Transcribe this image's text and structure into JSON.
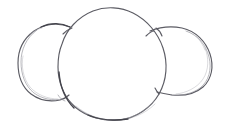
{
  "artwork": {
    "title": "Hand-drawn sketch of three overlapping circles",
    "medium": "pencil sketch",
    "background_color": "#ffffff",
    "stroke_color": "#5c5c64",
    "ghost_stroke_color": "#8e8e96",
    "dark_stroke_color": "#44444c",
    "canvas": {
      "width": 228,
      "height": 134
    },
    "shapes": [
      {
        "name": "left-circle",
        "role": "small left lobe",
        "center_x": 68,
        "center_y": 63,
        "radius_x": 49,
        "radius_y": 41,
        "has_double_stroke": true,
        "double_stroke_side": "left"
      },
      {
        "name": "center-circle",
        "role": "large central body",
        "center_x": 112,
        "center_y": 64,
        "radius_x": 54,
        "radius_y": 56,
        "has_double_stroke": true,
        "double_stroke_side": "bottom"
      },
      {
        "name": "right-circle",
        "role": "small right lobe",
        "center_x": 172,
        "center_y": 63,
        "radius_x": 44,
        "radius_y": 36,
        "has_double_stroke": true,
        "double_stroke_side": "right"
      }
    ],
    "intersections": [
      {
        "name": "left-top-crossing",
        "x": 68,
        "y": 28
      },
      {
        "name": "left-bottom-crossing",
        "x": 62,
        "y": 99
      },
      {
        "name": "right-top-crossing",
        "x": 152,
        "y": 32
      },
      {
        "name": "right-bottom-crossing",
        "x": 159,
        "y": 94
      }
    ]
  }
}
